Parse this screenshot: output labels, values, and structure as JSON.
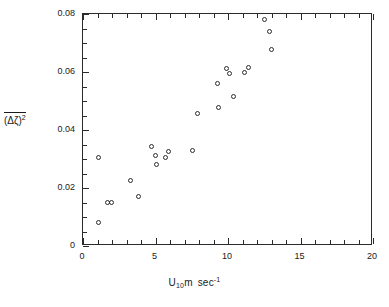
{
  "chart_data": {
    "type": "scatter",
    "title": "",
    "xlabel": "U10m sec-1",
    "xlabel_parts": {
      "symbol": "U",
      "subscript": "10",
      "unit": "m",
      "unit2": "sec",
      "superscript": "-1"
    },
    "ylabel": "(Δζ)2 overline",
    "ylabel_parts": {
      "base": "(Δζ)",
      "superscript": "2"
    },
    "xlim": [
      0,
      20
    ],
    "ylim": [
      0,
      0.08
    ],
    "xticks": [
      0,
      5,
      10,
      15,
      20
    ],
    "xticklabels": [
      "0",
      "5",
      "10",
      "15",
      "20"
    ],
    "xminor_step": 1,
    "yticks": [
      0,
      0.02,
      0.04,
      0.06,
      0.08
    ],
    "yticklabels": [
      "0",
      "0.02",
      "0.04",
      "0.06",
      "0.08"
    ],
    "yminor_step": 0.005,
    "grid": false,
    "legend": null,
    "marker": "open-circle",
    "marker_color": "#2b2b2b",
    "points": [
      {
        "x": 1.1,
        "y": 0.0302
      },
      {
        "x": 1.1,
        "y": 0.008
      },
      {
        "x": 1.75,
        "y": 0.0148
      },
      {
        "x": 2.0,
        "y": 0.0148
      },
      {
        "x": 3.3,
        "y": 0.0225
      },
      {
        "x": 3.85,
        "y": 0.017
      },
      {
        "x": 4.75,
        "y": 0.0343
      },
      {
        "x": 5.0,
        "y": 0.031
      },
      {
        "x": 5.1,
        "y": 0.0278
      },
      {
        "x": 5.75,
        "y": 0.0305
      },
      {
        "x": 5.95,
        "y": 0.0325
      },
      {
        "x": 7.6,
        "y": 0.0327
      },
      {
        "x": 7.95,
        "y": 0.0455
      },
      {
        "x": 9.3,
        "y": 0.056
      },
      {
        "x": 9.35,
        "y": 0.0475
      },
      {
        "x": 9.95,
        "y": 0.061
      },
      {
        "x": 10.15,
        "y": 0.0592
      },
      {
        "x": 10.4,
        "y": 0.0515
      },
      {
        "x": 11.15,
        "y": 0.0598
      },
      {
        "x": 11.45,
        "y": 0.0615
      },
      {
        "x": 12.55,
        "y": 0.078
      },
      {
        "x": 12.9,
        "y": 0.0737
      },
      {
        "x": 13.05,
        "y": 0.0677
      }
    ]
  }
}
